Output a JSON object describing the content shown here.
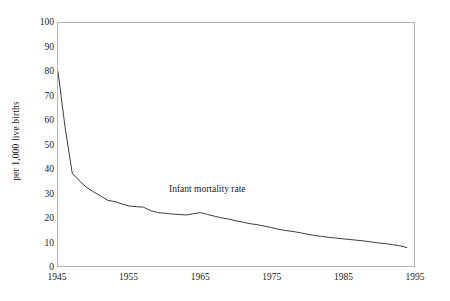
{
  "chart_data": {
    "type": "line",
    "title": "",
    "subtitle": "",
    "xlabel": "",
    "ylabel": "per 1,000 live births",
    "xlim": [
      1945,
      1995
    ],
    "ylim": [
      0,
      100
    ],
    "grid": false,
    "legend_position": "none",
    "xticks": [
      1945,
      1955,
      1965,
      1975,
      1985,
      1995
    ],
    "yticks": [
      0,
      10,
      20,
      30,
      40,
      50,
      60,
      70,
      80,
      90,
      100
    ],
    "annotations": [
      {
        "text": "Infant mortality rate",
        "x": 1966,
        "y": 32
      }
    ],
    "series": [
      {
        "name": "Infant mortality rate",
        "color": "#3c3c3c",
        "x": [
          1945,
          1946,
          1947,
          1948,
          1949,
          1950,
          1951,
          1952,
          1953,
          1954,
          1955,
          1956,
          1957,
          1958,
          1959,
          1960,
          1961,
          1962,
          1963,
          1964,
          1965,
          1966,
          1967,
          1968,
          1969,
          1970,
          1971,
          1972,
          1973,
          1974,
          1975,
          1976,
          1977,
          1978,
          1979,
          1980,
          1981,
          1982,
          1983,
          1984,
          1985,
          1986,
          1987,
          1988,
          1989,
          1990,
          1991,
          1992,
          1993,
          1994
        ],
        "values": [
          80.0,
          57.0,
          38.2,
          35.0,
          32.4,
          30.5,
          28.8,
          27.0,
          26.5,
          25.5,
          24.7,
          24.4,
          24.2,
          22.8,
          22.0,
          21.7,
          21.4,
          21.2,
          21.0,
          21.5,
          22.0,
          21.2,
          20.5,
          19.8,
          19.3,
          18.6,
          18.0,
          17.4,
          17.0,
          16.4,
          15.8,
          15.1,
          14.6,
          14.2,
          13.7,
          13.1,
          12.6,
          12.2,
          11.8,
          11.5,
          11.2,
          10.9,
          10.6,
          10.3,
          9.9,
          9.5,
          9.2,
          8.8,
          8.3,
          7.6
        ]
      }
    ]
  },
  "axis": {
    "y_title": "per 1,000 live births",
    "y_tick_labels": [
      "100",
      "90",
      "80",
      "70",
      "60",
      "50",
      "40",
      "30",
      "20",
      "10",
      "0"
    ],
    "x_tick_labels": [
      "1945",
      "1955",
      "1965",
      "1975",
      "1985",
      "1995"
    ]
  },
  "annotation": {
    "series_label": "Infant mortality rate"
  }
}
